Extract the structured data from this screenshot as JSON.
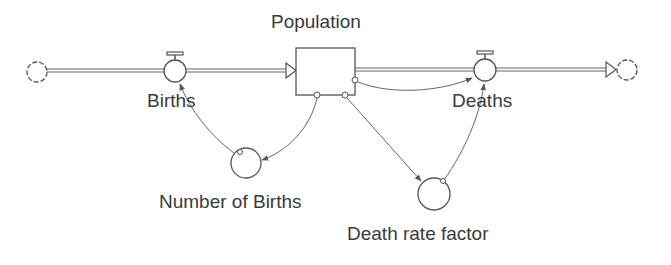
{
  "diagram": {
    "type": "stock-and-flow",
    "stock": {
      "label": "Population"
    },
    "flows": [
      {
        "id": "births",
        "label": "Births",
        "from": "source-cloud",
        "to": "Population"
      },
      {
        "id": "deaths",
        "label": "Deaths",
        "from": "Population",
        "to": "sink-cloud"
      }
    ],
    "auxiliaries": [
      {
        "id": "number_of_births",
        "label": "Number of Births"
      },
      {
        "id": "death_rate_factor",
        "label": "Death rate factor"
      }
    ],
    "links": [
      {
        "from": "Population",
        "to": "Number of Births"
      },
      {
        "from": "Number of Births",
        "to": "Births"
      },
      {
        "from": "Population",
        "to": "Deaths"
      },
      {
        "from": "Population",
        "to": "Death rate factor"
      },
      {
        "from": "Death rate factor",
        "to": "Deaths"
      }
    ],
    "colors": {
      "line": "#555555",
      "text": "#3a3a3a",
      "background": "#ffffff"
    }
  }
}
